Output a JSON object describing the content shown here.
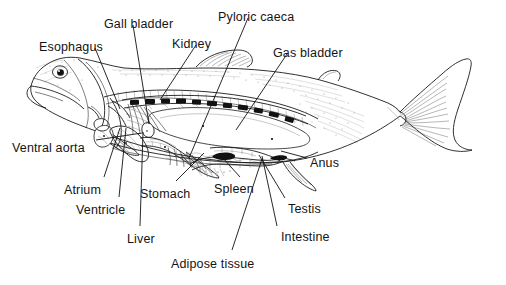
{
  "figure": {
    "style": "black and white line drawing with stippled shading",
    "background_color": "#ffffff",
    "line_color": "#111111",
    "text_color": "#141414"
  },
  "labels": [
    {
      "id": "gall-bladder",
      "text": "Gall bladder",
      "x": 104,
      "y": 18,
      "anchor": "start"
    },
    {
      "id": "pyloric-caeca",
      "text": "Pyloric caeca",
      "x": 218,
      "y": 11,
      "anchor": "start"
    },
    {
      "id": "esophagus",
      "text": "Esophagus",
      "x": 39,
      "y": 41,
      "anchor": "start"
    },
    {
      "id": "kidney",
      "text": "Kidney",
      "x": 172,
      "y": 38,
      "anchor": "start"
    },
    {
      "id": "gas-bladder",
      "text": "Gas bladder",
      "x": 273,
      "y": 47,
      "anchor": "start"
    },
    {
      "id": "ventral-aorta",
      "text": "Ventral aorta",
      "x": 12,
      "y": 142,
      "anchor": "start"
    },
    {
      "id": "anus",
      "text": "Anus",
      "x": 310,
      "y": 157,
      "anchor": "start"
    },
    {
      "id": "atrium",
      "text": "Atrium",
      "x": 64,
      "y": 184,
      "anchor": "start"
    },
    {
      "id": "stomach",
      "text": "Stomach",
      "x": 140,
      "y": 188,
      "anchor": "start"
    },
    {
      "id": "spleen",
      "text": "Spleen",
      "x": 214,
      "y": 183,
      "anchor": "start"
    },
    {
      "id": "ventricle",
      "text": "Ventricle",
      "x": 76,
      "y": 204,
      "anchor": "start"
    },
    {
      "id": "testis",
      "text": "Testis",
      "x": 288,
      "y": 203,
      "anchor": "start"
    },
    {
      "id": "liver",
      "text": "Liver",
      "x": 127,
      "y": 233,
      "anchor": "start"
    },
    {
      "id": "intestine",
      "text": "Intestine",
      "x": 281,
      "y": 231,
      "anchor": "start"
    },
    {
      "id": "adipose-tissue",
      "text": "Adipose tissue",
      "x": 171,
      "y": 258,
      "anchor": "start"
    }
  ],
  "anatomy_parts": [
    "Gall bladder",
    "Pyloric caeca",
    "Esophagus",
    "Kidney",
    "Gas bladder",
    "Ventral aorta",
    "Anus",
    "Atrium",
    "Stomach",
    "Spleen",
    "Ventricle",
    "Testis",
    "Liver",
    "Intestine",
    "Adipose tissue"
  ]
}
